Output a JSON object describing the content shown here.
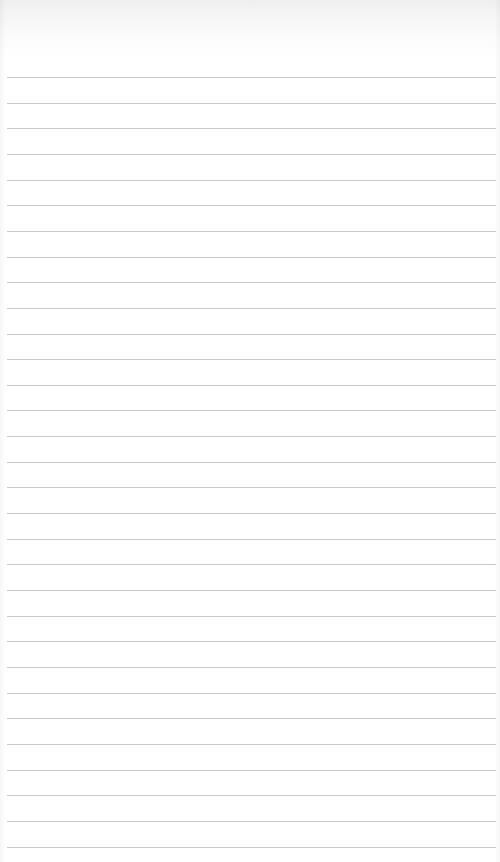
{
  "page": {
    "type": "lined-paper",
    "background_color": "#ffffff",
    "line_color": "#c9c9c9",
    "line_count": 31,
    "first_line_y": 77,
    "line_pitch": 25.65,
    "line_left": 7,
    "line_right": 496
  },
  "lines": [
    {
      "text": ""
    },
    {
      "text": ""
    },
    {
      "text": ""
    },
    {
      "text": ""
    },
    {
      "text": ""
    },
    {
      "text": ""
    },
    {
      "text": ""
    },
    {
      "text": ""
    },
    {
      "text": ""
    },
    {
      "text": ""
    },
    {
      "text": ""
    },
    {
      "text": ""
    },
    {
      "text": ""
    },
    {
      "text": ""
    },
    {
      "text": ""
    },
    {
      "text": ""
    },
    {
      "text": ""
    },
    {
      "text": ""
    },
    {
      "text": ""
    },
    {
      "text": ""
    },
    {
      "text": ""
    },
    {
      "text": ""
    },
    {
      "text": ""
    },
    {
      "text": ""
    },
    {
      "text": ""
    },
    {
      "text": ""
    },
    {
      "text": ""
    },
    {
      "text": ""
    },
    {
      "text": ""
    },
    {
      "text": ""
    },
    {
      "text": ""
    }
  ]
}
